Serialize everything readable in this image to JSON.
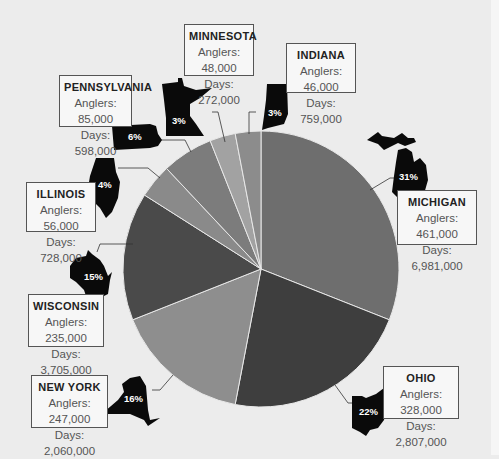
{
  "chart_data": {
    "type": "pie",
    "title": "",
    "categories": [
      "Michigan",
      "Ohio",
      "New York",
      "Wisconsin",
      "Illinois",
      "Pennsylvania",
      "Minnesota",
      "Indiana"
    ],
    "values": [
      31,
      22,
      16,
      15,
      4,
      6,
      3,
      3
    ],
    "unit": "%",
    "series": [
      {
        "name": "Share (%)",
        "values": [
          31,
          22,
          16,
          15,
          4,
          6,
          3,
          3
        ]
      },
      {
        "name": "Anglers",
        "values": [
          461000,
          328000,
          247000,
          235000,
          56000,
          85000,
          48000,
          46000
        ]
      },
      {
        "name": "Days",
        "values": [
          6981000,
          2807000,
          2060000,
          3705000,
          728000,
          598000,
          272000,
          759000
        ]
      }
    ],
    "slice_colors": [
      "#6e6e6e",
      "#3e3e3e",
      "#8e8e8e",
      "#4a4a4a",
      "#8a8a8a",
      "#7c7c7c",
      "#a2a2a2",
      "#8c8c8c"
    ],
    "legend_position": "none (callout labels)"
  },
  "states": [
    {
      "key": "michigan",
      "name": "MICHIGAN",
      "pct": "31%",
      "anglers": "Anglers: 461,000",
      "days": "Days: 6,981,000"
    },
    {
      "key": "ohio",
      "name": "OHIO",
      "pct": "22%",
      "anglers": "Anglers: 328,000",
      "days": "Days: 2,807,000"
    },
    {
      "key": "newyork",
      "name": "NEW YORK",
      "pct": "16%",
      "anglers": "Anglers: 247,000",
      "days": "Days: 2,060,000"
    },
    {
      "key": "wisconsin",
      "name": "WISCONSIN",
      "pct": "15%",
      "anglers": "Anglers: 235,000",
      "days": "Days: 3,705,000"
    },
    {
      "key": "illinois",
      "name": "ILLINOIS",
      "pct": "4%",
      "anglers": "Anglers: 56,000",
      "days": "Days: 728,000"
    },
    {
      "key": "pennsylvania",
      "name": "PENNSYLVANIA",
      "pct": "6%",
      "anglers": "Anglers: 85,000",
      "days": "Days: 598,000"
    },
    {
      "key": "minnesota",
      "name": "MINNESOTA",
      "pct": "3%",
      "anglers": "Anglers: 48,000",
      "days": "Days: 272,000"
    },
    {
      "key": "indiana",
      "name": "INDIANA",
      "pct": "3%",
      "anglers": "Anglers: 46,000",
      "days": "Days: 759,000"
    }
  ]
}
